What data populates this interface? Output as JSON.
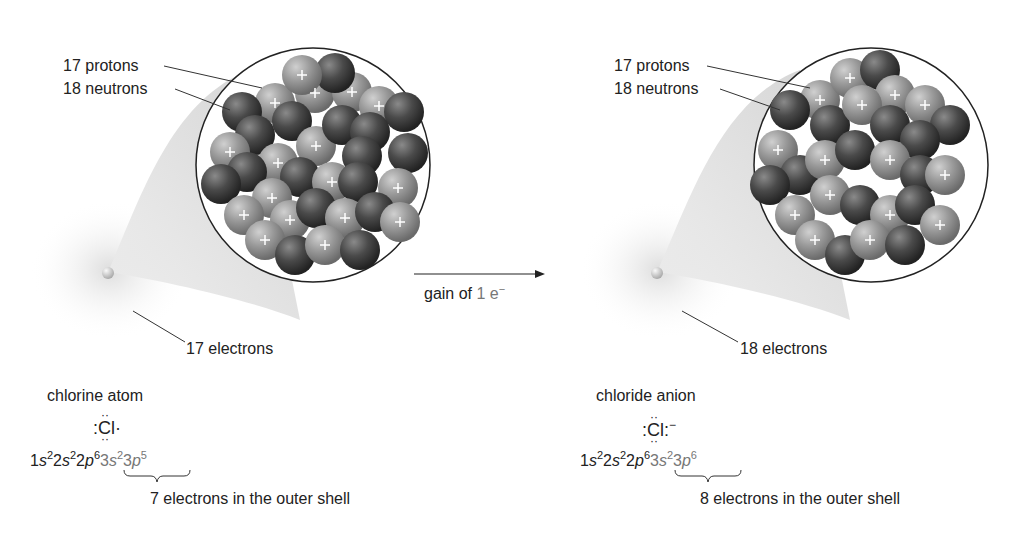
{
  "left_panel": {
    "protons_label": "17 protons",
    "neutrons_label": "18 neutrons",
    "electrons_label": "17 electrons",
    "species_name": "chlorine atom",
    "lewis_symbol": "Cl",
    "lewis_right": "·",
    "config": {
      "inner": [
        [
          "1",
          "s",
          "2"
        ],
        [
          "2",
          "s",
          "2"
        ],
        [
          "2",
          "p",
          "6"
        ]
      ],
      "outer": [
        [
          "3",
          "s",
          "2"
        ],
        [
          "3",
          "p",
          "5"
        ]
      ]
    },
    "outer_shell_note": "7 electrons in the outer shell"
  },
  "arrow": {
    "label_prefix": "gain of ",
    "label_value": "1 e",
    "label_sup": "−"
  },
  "right_panel": {
    "protons_label": "17 protons",
    "neutrons_label": "18 neutrons",
    "electrons_label": "18 electrons",
    "species_name": "chloride anion",
    "lewis_symbol": "Cl",
    "lewis_right": ":",
    "charge": "−",
    "config": {
      "inner": [
        [
          "1",
          "s",
          "2"
        ],
        [
          "2",
          "s",
          "2"
        ],
        [
          "2",
          "p",
          "6"
        ]
      ],
      "outer": [
        [
          "3s",
          "",
          "2"
        ],
        [
          "3",
          "p",
          "6"
        ]
      ]
    },
    "outer_shell_note": "8 electrons in the outer shell"
  },
  "colors": {
    "proton": "#9a9a9a",
    "neutron": "#4a4a4a",
    "text": "#222222",
    "highlight_text": "#777777"
  }
}
